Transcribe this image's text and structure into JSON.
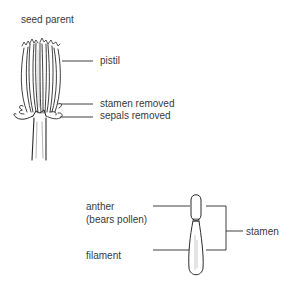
{
  "diagram": {
    "top": {
      "title": "seed parent",
      "labels": {
        "pistil": "pistil",
        "stamen_removed": "stamen removed",
        "sepals_removed": "sepals removed"
      }
    },
    "bottom": {
      "labels": {
        "anther": "anther",
        "anther_note": "(bears pollen)",
        "filament": "filament",
        "stamen": "stamen"
      }
    },
    "colors": {
      "line": "#2a2a2a",
      "text": "#3a3a3a",
      "background": "#ffffff"
    }
  }
}
